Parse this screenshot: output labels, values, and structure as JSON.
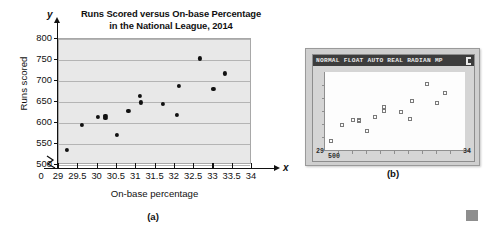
{
  "figure": {
    "panel_a_caption": "(a)",
    "panel_b_caption": "(b)"
  },
  "chart_data": [
    {
      "type": "scatter",
      "panel": "(a)",
      "title": "Runs Scored versus On-base Percentage in the National League, 2014",
      "title_line1": "Runs Scored versus On-base Percentage",
      "title_line2": "in the National League, 2014",
      "xlabel": "On-base percentage",
      "ylabel": "Runs scored",
      "x_axis_variable": "x",
      "y_axis_variable": "y",
      "origin_label": "0",
      "axis_break": true,
      "grid": true,
      "grid_axis": "y",
      "legend": "none",
      "xlim": [
        29,
        34
      ],
      "ylim": [
        500,
        800
      ],
      "xticks": [
        "29",
        "29.5",
        "30",
        "30.5",
        "31",
        "31.5",
        "32",
        "32.5",
        "33",
        "33.5",
        "34"
      ],
      "xtick_values": [
        29,
        29.5,
        30,
        30.5,
        31,
        31.5,
        32,
        32.5,
        33,
        33.5,
        34
      ],
      "yticks": [
        "500",
        "550",
        "600",
        "650",
        "700",
        "750",
        "800"
      ],
      "ytick_values": [
        500,
        550,
        600,
        650,
        700,
        750,
        800
      ],
      "points": [
        {
          "x": 29.2,
          "y": 535
        },
        {
          "x": 29.6,
          "y": 595
        },
        {
          "x": 30.0,
          "y": 614
        },
        {
          "x": 30.2,
          "y": 617
        },
        {
          "x": 30.2,
          "y": 612
        },
        {
          "x": 30.5,
          "y": 572
        },
        {
          "x": 30.8,
          "y": 628
        },
        {
          "x": 31.1,
          "y": 664
        },
        {
          "x": 31.12,
          "y": 649
        },
        {
          "x": 31.7,
          "y": 645
        },
        {
          "x": 32.05,
          "y": 620
        },
        {
          "x": 32.1,
          "y": 689
        },
        {
          "x": 32.65,
          "y": 754
        },
        {
          "x": 33.0,
          "y": 682
        },
        {
          "x": 33.3,
          "y": 718
        }
      ],
      "marker": "filled-circle",
      "marker_color": "#111111",
      "plot_background": "#e8e8e8",
      "gridline_color": "#b4b4b4"
    },
    {
      "type": "scatter",
      "panel": "(b)",
      "device": "graphing-calculator",
      "status_bar": "NORMAL FLOAT AUTO REAL RADIAN MP",
      "xlim": [
        29,
        34
      ],
      "ylim": [
        500,
        800
      ],
      "x_min_label": "29",
      "x_max_label": "34",
      "y_min_label": "500",
      "y_max_label": "800",
      "grid": false,
      "marker": "open-square",
      "marker_color": "#7a7a7a",
      "screen_background": "#fdfdfd",
      "points": [
        {
          "x": 29.2,
          "y": 535
        },
        {
          "x": 29.6,
          "y": 595
        },
        {
          "x": 30.0,
          "y": 614
        },
        {
          "x": 30.2,
          "y": 617
        },
        {
          "x": 30.2,
          "y": 612
        },
        {
          "x": 30.5,
          "y": 572
        },
        {
          "x": 30.8,
          "y": 628
        },
        {
          "x": 31.1,
          "y": 664
        },
        {
          "x": 31.12,
          "y": 649
        },
        {
          "x": 31.7,
          "y": 645
        },
        {
          "x": 32.05,
          "y": 620
        },
        {
          "x": 32.1,
          "y": 689
        },
        {
          "x": 32.65,
          "y": 754
        },
        {
          "x": 33.0,
          "y": 682
        },
        {
          "x": 33.3,
          "y": 718
        }
      ]
    }
  ]
}
